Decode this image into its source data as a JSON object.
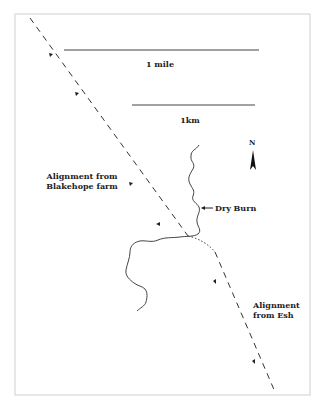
{
  "map": {
    "frame": {
      "x": 15,
      "y": 14,
      "width": 295,
      "height": 381,
      "color": "#c8c8c8"
    },
    "scale_bars": [
      {
        "label": "1 mile",
        "x1": 64,
        "x2": 259,
        "y": 50
      },
      {
        "label": "1km",
        "x1": 132,
        "x2": 255,
        "y": 105
      }
    ],
    "north_arrow": {
      "label": "N",
      "x": 253,
      "y": 143
    },
    "labels": {
      "river": "Dry Burn",
      "alignment_nw": "Alignment from\nBlakehope farm",
      "alignment_se": "Alignment\nfrom Esh"
    },
    "colors": {
      "line": "#333333",
      "river": "#444444",
      "frame": "#c8c8c8"
    }
  }
}
